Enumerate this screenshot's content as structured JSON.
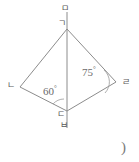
{
  "figure": {
    "line_color": "#8c8c8c",
    "text_color": "#5a5a5a",
    "background": "#ffffff",
    "vertices": [
      {
        "name": "apex",
        "label": "ㄱ",
        "x": 67,
        "y": 29,
        "label_x": 58,
        "label_y": 19
      },
      {
        "name": "left",
        "label": "ㄴ",
        "x": 20,
        "y": 87,
        "label_x": 7,
        "label_y": 81
      },
      {
        "name": "right",
        "label": "ㄹ",
        "x": 116,
        "y": 82,
        "label_x": 122,
        "label_y": 78
      },
      {
        "name": "bottom",
        "label": "ㄷ",
        "x": 67,
        "y": 111,
        "label_x": 57,
        "label_y": 110
      }
    ],
    "axis_points": [
      {
        "name": "axis-top",
        "label": "ㅁ",
        "x": 67,
        "y": 10,
        "label_x": 61,
        "label_y": 4
      },
      {
        "name": "axis-bottom",
        "label": "ㅂ",
        "x": 67,
        "y": 130,
        "label_x": 60,
        "label_y": 121
      }
    ],
    "angles": [
      {
        "name": "angle-at-bottom-vertex",
        "value": "60",
        "degree_symbol": "°",
        "label_x": 43,
        "label_y": 85
      },
      {
        "name": "angle-at-right-vertex",
        "value": "75",
        "degree_symbol": "°",
        "label_x": 82,
        "label_y": 66
      }
    ],
    "annotation": {
      "name": "closing-paren",
      "text": ")",
      "x": 121,
      "y": 140
    }
  }
}
